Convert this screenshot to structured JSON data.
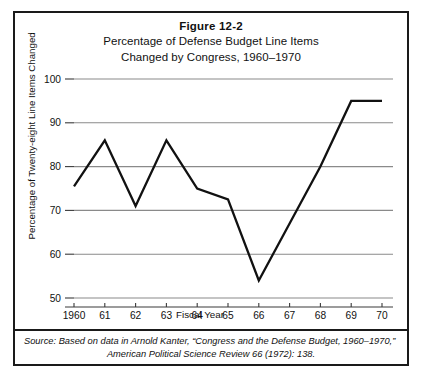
{
  "figure": {
    "number": "Figure 12-2",
    "title_line_1": "Percentage of Defense Budget Line Items",
    "title_line_2": "Changed by Congress, 1960–1970"
  },
  "source": {
    "label": "Source:",
    "line_1": "Based on data in Arnold Kanter, “Congress and the Defense Budget, 1960–1970,”",
    "line_2": "American Political Science Review 66 (1972): 138."
  },
  "chart_data": {
    "type": "line",
    "title": "Percentage of Defense Budget Line Items Changed by Congress, 1960–1970",
    "xlabel": "Fiscal Year",
    "ylabel": "Percentage of Twenty-eight Line Items Changed",
    "categories": [
      "1960",
      "61",
      "62",
      "63",
      "64",
      "65",
      "66",
      "67",
      "68",
      "69",
      "70"
    ],
    "x": [
      1960,
      1961,
      1962,
      1963,
      1964,
      1965,
      1966,
      1967,
      1968,
      1969,
      1970
    ],
    "values": [
      75.5,
      86,
      71,
      86,
      75,
      72.5,
      54,
      67,
      80,
      95,
      95
    ],
    "ylim": [
      50,
      100
    ],
    "yticks": [
      50,
      60,
      70,
      80,
      90,
      100
    ],
    "ytick_labels": [
      "50",
      "60",
      "70",
      "80",
      "90",
      "100"
    ],
    "grid": true,
    "legend": "none",
    "line_color": "#111111",
    "grid_color": "#8a8a8a"
  }
}
